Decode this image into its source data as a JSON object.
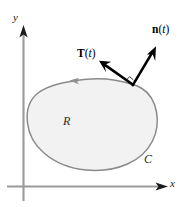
{
  "figure": {
    "background_color": "#ffffff",
    "axes": {
      "x_axis_label": "x",
      "y_axis_label": "y",
      "axis_color": "#8c8c8c",
      "arrowhead_color": "#1a1a1a"
    },
    "region": {
      "label": "R",
      "fill_color": "#f2f2f2",
      "stroke_color": "#8a8a8a"
    },
    "curve": {
      "label": "C",
      "orientation": "counterclockwise",
      "orientation_marker": "direction-arrowhead"
    },
    "vectors": [
      {
        "name": "tangent-vector",
        "symbol": "T",
        "argument": "t",
        "label_open_paren": "(",
        "label_close_paren": ")",
        "color": "#000000"
      },
      {
        "name": "normal-vector",
        "symbol": "n",
        "argument": "t",
        "label_open_paren": "(",
        "label_close_paren": ")",
        "color": "#000000"
      }
    ],
    "markers": {
      "right_angle": "perpendicular-square"
    }
  }
}
